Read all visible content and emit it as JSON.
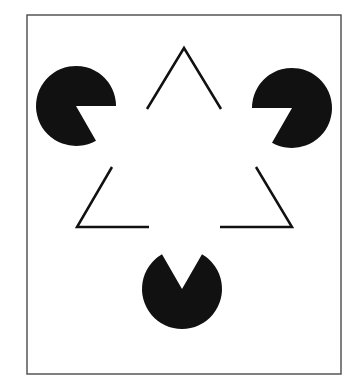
{
  "figure": {
    "colors": {
      "background": "#ffffff",
      "ink": "#111111",
      "frame": "#555555"
    },
    "frame": {
      "x": 27,
      "y": 15,
      "w": 314,
      "h": 359
    },
    "pacmen": [
      {
        "cx": 76,
        "cy": 106,
        "r": 40,
        "notch_deg": [
          0,
          60
        ]
      },
      {
        "cx": 292,
        "cy": 108,
        "r": 40,
        "notch_deg": [
          120,
          180
        ]
      },
      {
        "cx": 182,
        "cy": 289,
        "r": 40,
        "notch_deg": [
          240,
          300
        ]
      }
    ],
    "segments": [
      [
        [
          147,
          109
        ],
        [
          184,
          48
        ],
        [
          221,
          109
        ]
      ],
      [
        [
          112,
          167
        ],
        [
          77,
          227
        ],
        [
          149,
          227
        ]
      ],
      [
        [
          256,
          167
        ],
        [
          292,
          227
        ],
        [
          220,
          227
        ]
      ]
    ]
  }
}
